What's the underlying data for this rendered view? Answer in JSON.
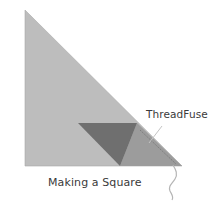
{
  "diagram": {
    "title": "Making a Square",
    "labels": {
      "thread": "ThreadFuse",
      "caption": "Making a Square"
    },
    "colors": {
      "background": "#ffffff",
      "fabric_light": "#bdbdbd",
      "fabric_overlap": "#9c9c9c",
      "fabric_dark": "#6f6f6f",
      "stitch_line": "#7d7d7d",
      "leader_line": "#c4c4c4",
      "thread": "#b5b5b5",
      "text": "#3a3a3a"
    }
  }
}
